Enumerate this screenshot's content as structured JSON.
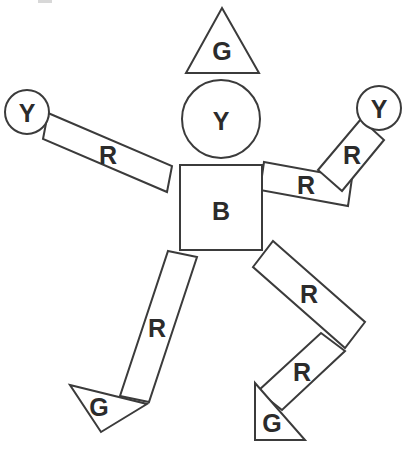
{
  "diagram": {
    "background_color": "#ffffff",
    "stroke_color": "#3b3b3b",
    "label_color": "#2b2b2b",
    "canvas": {
      "width": 412,
      "height": 463
    },
    "legend": {
      "G": "green-triangle-part",
      "Y": "yellow-circle-part",
      "R": "red-rectangle-part",
      "B": "blue-square-part"
    },
    "parts": [
      {
        "id": "hat",
        "name": "hat-triangle",
        "label": "G",
        "shape": "triangle",
        "points": "222,8 259,73 186,73",
        "label_x": 222,
        "label_y": 51
      },
      {
        "id": "head",
        "name": "head-circle",
        "label": "Y",
        "shape": "circle",
        "cx": 221,
        "cy": 119,
        "r": 39,
        "label_x": 221,
        "label_y": 121
      },
      {
        "id": "torso",
        "name": "torso-square",
        "label": "B",
        "shape": "rect",
        "points": "180,165 262,165 262,250 180,250",
        "label_x": 221,
        "label_y": 211
      },
      {
        "id": "left-hand",
        "name": "left-hand-circle",
        "label": "Y",
        "shape": "circle",
        "cx": 27,
        "cy": 112,
        "r": 22,
        "label_x": 27,
        "label_y": 113
      },
      {
        "id": "left-arm",
        "name": "left-arm-rectangle",
        "label": "R",
        "shape": "rect",
        "points": "48,113 172,166 167,192 43,139",
        "label_x": 108,
        "label_y": 155
      },
      {
        "id": "right-upper-arm",
        "name": "right-upper-arm-rectangle",
        "label": "R",
        "shape": "rect",
        "points": "264,162 352,178 348,206 260,190",
        "label_x": 306,
        "label_y": 185
      },
      {
        "id": "right-forearm",
        "name": "right-forearm-rectangle",
        "label": "R",
        "shape": "rect",
        "points": "361,119 384,140 342,191 318,170",
        "label_x": 352,
        "label_y": 155
      },
      {
        "id": "right-hand",
        "name": "right-hand-circle",
        "label": "Y",
        "shape": "circle",
        "cx": 379,
        "cy": 108,
        "r": 22,
        "label_x": 379,
        "label_y": 109
      },
      {
        "id": "left-leg",
        "name": "left-leg-rectangle",
        "label": "R",
        "shape": "rect",
        "points": "168,251 197,257 149,402 120,396",
        "label_x": 157,
        "label_y": 328
      },
      {
        "id": "left-foot",
        "name": "left-foot-triangle",
        "label": "G",
        "shape": "triangle",
        "points": "70,385 147,404 101,432",
        "label_x": 99,
        "label_y": 407
      },
      {
        "id": "right-thigh",
        "name": "right-thigh-rectangle",
        "label": "R",
        "shape": "rect",
        "points": "273,241 365,322 345,348 253,267",
        "label_x": 309,
        "label_y": 294
      },
      {
        "id": "right-shin",
        "name": "right-shin-rectangle",
        "label": "R",
        "shape": "rect",
        "points": "321,333 345,351 282,410 258,391",
        "label_x": 302,
        "label_y": 372
      },
      {
        "id": "right-foot",
        "name": "right-foot-triangle",
        "label": "G",
        "shape": "triangle",
        "points": "255,383 305,440 255,440",
        "label_x": 272,
        "label_y": 423
      }
    ],
    "artifact": {
      "name": "top-edge-artifact",
      "x": 38,
      "y": 0,
      "width": 14,
      "height": 3
    }
  }
}
